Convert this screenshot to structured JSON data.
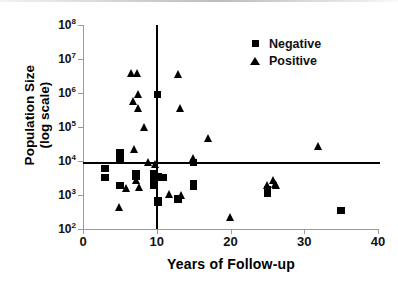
{
  "chart_data": {
    "type": "scatter",
    "title": "",
    "xlabel": "Years of Follow-up",
    "ylabel_line1": "Population Size",
    "ylabel_line2": "(log scale)",
    "ylabel": "Population Size (log scale)",
    "xlim": [
      0,
      40
    ],
    "ylim": [
      100,
      100000000
    ],
    "y_scale": "log",
    "grid": false,
    "legend_position": "top-right",
    "x_ticks": [
      0,
      10,
      20,
      30,
      40
    ],
    "x_tick_labels": [
      "0",
      "10",
      "20",
      "30",
      "40"
    ],
    "y_ticks": [
      100,
      1000,
      10000,
      100000,
      1000000,
      10000000,
      100000000
    ],
    "y_tick_labels": [
      "10",
      "10",
      "10",
      "10",
      "10",
      "10",
      "10"
    ],
    "y_tick_exponents": [
      "2",
      "3",
      "4",
      "5",
      "6",
      "7",
      "8"
    ],
    "reference_lines": [
      {
        "name": "horizontal-threshold",
        "orientation": "horizontal",
        "value": 9000
      },
      {
        "name": "vertical-threshold",
        "orientation": "vertical",
        "value": 10
      }
    ],
    "series": [
      {
        "name": "Negative",
        "marker": "square",
        "color": "#000000",
        "points": [
          {
            "x": 3.0,
            "y": 6000
          },
          {
            "x": 3.0,
            "y": 3300
          },
          {
            "x": 5.0,
            "y": 17000
          },
          {
            "x": 5.0,
            "y": 11000
          },
          {
            "x": 5.0,
            "y": 1900
          },
          {
            "x": 7.2,
            "y": 4300
          },
          {
            "x": 7.2,
            "y": 3500
          },
          {
            "x": 9.6,
            "y": 4200
          },
          {
            "x": 9.6,
            "y": 3000
          },
          {
            "x": 9.6,
            "y": 2400
          },
          {
            "x": 9.6,
            "y": 2000
          },
          {
            "x": 10.1,
            "y": 900000
          },
          {
            "x": 10.2,
            "y": 3400
          },
          {
            "x": 10.2,
            "y": 700
          },
          {
            "x": 10.2,
            "y": 600
          },
          {
            "x": 10.9,
            "y": 3300
          },
          {
            "x": 12.9,
            "y": 760
          },
          {
            "x": 12.9,
            "y": 740
          },
          {
            "x": 15.0,
            "y": 9000
          },
          {
            "x": 15.0,
            "y": 2200
          },
          {
            "x": 15.0,
            "y": 1800
          },
          {
            "x": 25.0,
            "y": 1400
          },
          {
            "x": 25.0,
            "y": 1150
          },
          {
            "x": 35.0,
            "y": 350
          }
        ]
      },
      {
        "name": "Positive",
        "marker": "triangle",
        "color": "#000000",
        "points": [
          {
            "x": 5.0,
            "y": 440
          },
          {
            "x": 5.9,
            "y": 1500
          },
          {
            "x": 6.6,
            "y": 3600000
          },
          {
            "x": 7.4,
            "y": 3600000
          },
          {
            "x": 6.8,
            "y": 550000
          },
          {
            "x": 7.5,
            "y": 900000
          },
          {
            "x": 7.0,
            "y": 22000
          },
          {
            "x": 7.6,
            "y": 350000
          },
          {
            "x": 7.3,
            "y": 2700
          },
          {
            "x": 7.7,
            "y": 1700
          },
          {
            "x": 8.4,
            "y": 95000
          },
          {
            "x": 8.9,
            "y": 9000
          },
          {
            "x": 9.9,
            "y": 7800
          },
          {
            "x": 11.8,
            "y": 1050
          },
          {
            "x": 13.4,
            "y": 950
          },
          {
            "x": 13.0,
            "y": 3500000
          },
          {
            "x": 13.3,
            "y": 350000
          },
          {
            "x": 15.0,
            "y": 12000
          },
          {
            "x": 17.0,
            "y": 45000
          },
          {
            "x": 20.0,
            "y": 220
          },
          {
            "x": 25.0,
            "y": 1900
          },
          {
            "x": 25.9,
            "y": 2600
          },
          {
            "x": 26.1,
            "y": 2000
          },
          {
            "x": 26.2,
            "y": 1850
          },
          {
            "x": 32.0,
            "y": 26000
          }
        ]
      }
    ],
    "legend_entries": [
      {
        "label": "Negative",
        "marker": "square"
      },
      {
        "label": "Positive",
        "marker": "triangle"
      }
    ]
  }
}
